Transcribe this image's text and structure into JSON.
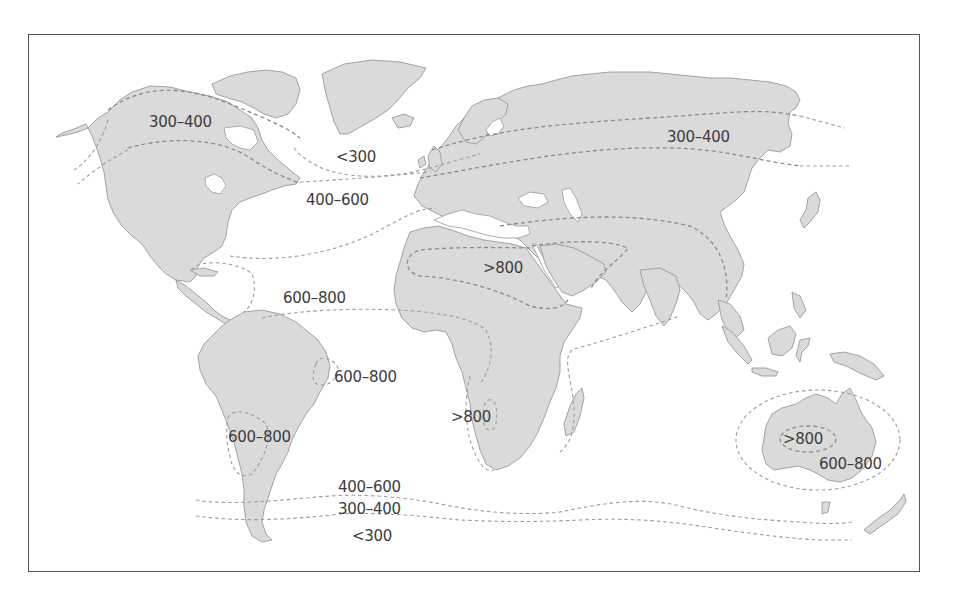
{
  "map": {
    "type": "world-isoline-map",
    "colors": {
      "land": "#dadada",
      "coast": "#9a9a9a",
      "isoline": "#8a8a8a",
      "label": "#3c3c3c",
      "frame": "#555555",
      "background": "#ffffff"
    },
    "labels": [
      {
        "id": "na-north",
        "text": "300–400",
        "x": 149,
        "y": 115
      },
      {
        "id": "n-atlantic-low",
        "text": "<300",
        "x": 336,
        "y": 150
      },
      {
        "id": "n-atlantic-mid",
        "text": "400–600",
        "x": 306,
        "y": 193
      },
      {
        "id": "eurasia-north",
        "text": "300–400",
        "x": 667,
        "y": 130
      },
      {
        "id": "sahara",
        "text": ">800",
        "x": 483,
        "y": 261
      },
      {
        "id": "tropical-atlantic",
        "text": "600–800",
        "x": 283,
        "y": 291
      },
      {
        "id": "ne-brazil",
        "text": "600–800",
        "x": 334,
        "y": 370
      },
      {
        "id": "kalahari",
        "text": ">800",
        "x": 451,
        "y": 410
      },
      {
        "id": "chaco",
        "text": "600–800",
        "x": 228,
        "y": 430
      },
      {
        "id": "central-australia",
        "text": ">800",
        "x": 783,
        "y": 432
      },
      {
        "id": "australia-outer",
        "text": "600–800",
        "x": 819,
        "y": 457
      },
      {
        "id": "southern-ocean-1",
        "text": "400–600",
        "x": 338,
        "y": 480
      },
      {
        "id": "southern-ocean-2",
        "text": "300–400",
        "x": 338,
        "y": 502
      },
      {
        "id": "southern-ocean-3",
        "text": "<300",
        "x": 352,
        "y": 529
      }
    ]
  }
}
